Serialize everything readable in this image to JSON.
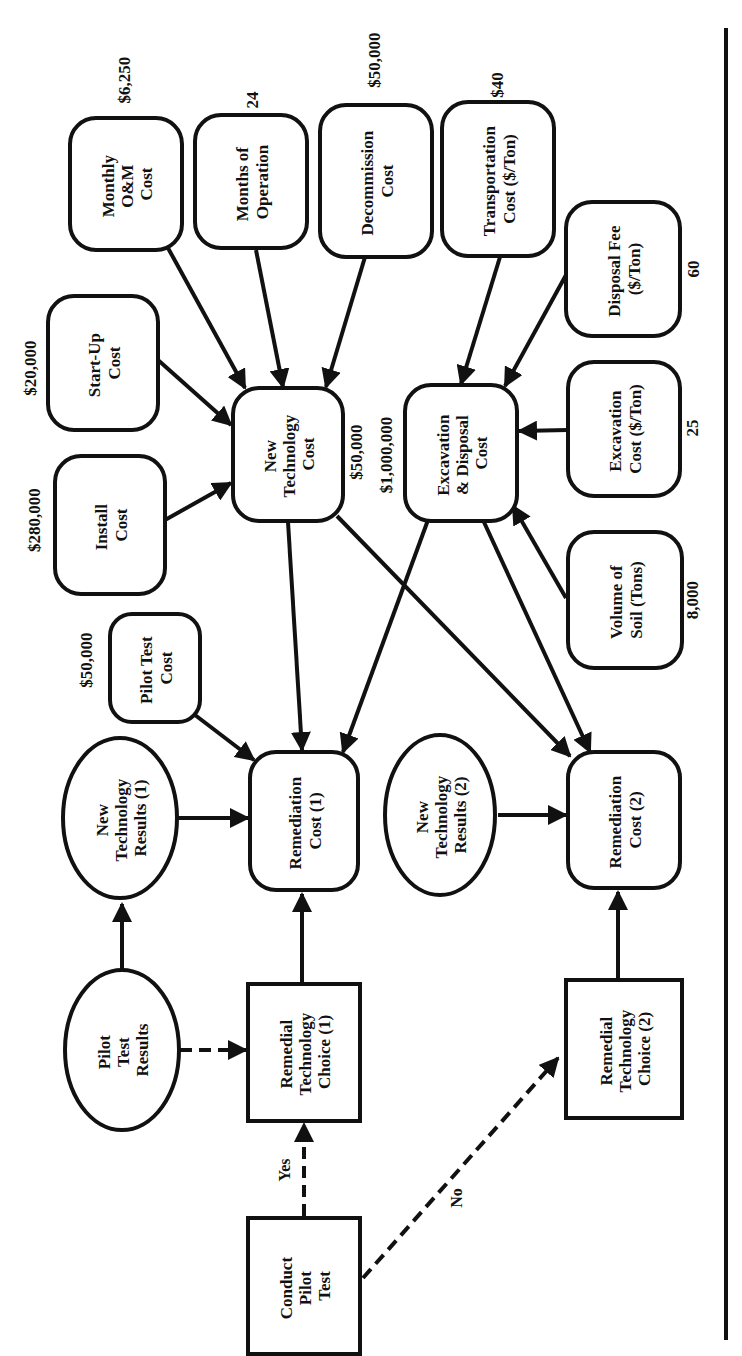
{
  "diagram": {
    "orientation": "rotated 90 degrees counter-clockwise",
    "colors": {
      "stroke": "#111111",
      "background": "#ffffff"
    },
    "nodes": [
      {
        "id": "monthly_om_cost",
        "shape": "rounded-rect",
        "lines": [
          "Monthly",
          "O&M",
          "Cost"
        ],
        "value": "$6,250"
      },
      {
        "id": "months_of_operation",
        "shape": "rounded-rect",
        "lines": [
          "Months of",
          "Operation"
        ],
        "value": "24"
      },
      {
        "id": "decommission_cost",
        "shape": "rounded-rect",
        "lines": [
          "Decommission",
          "Cost"
        ],
        "value": "$50,000"
      },
      {
        "id": "transportation_cost",
        "shape": "rounded-rect",
        "lines": [
          "Transportation",
          "Cost ($/Ton)"
        ],
        "value": "$40"
      },
      {
        "id": "disposal_fee",
        "shape": "rounded-rect",
        "lines": [
          "Disposal Fee",
          "($/Ton)"
        ],
        "value": "60"
      },
      {
        "id": "start_up_cost",
        "shape": "rounded-rect",
        "lines": [
          "Start-Up",
          "Cost"
        ],
        "value": "$20,000"
      },
      {
        "id": "install_cost",
        "shape": "rounded-rect",
        "lines": [
          "Install",
          "Cost"
        ],
        "value": "$280,000"
      },
      {
        "id": "new_technology_cost",
        "shape": "rounded-rect",
        "lines": [
          "New",
          "Technology",
          "Cost"
        ],
        "value": "$50,000"
      },
      {
        "id": "excavation_disposal_cost",
        "shape": "rounded-rect",
        "lines": [
          "Excavation",
          "& Disposal",
          "Cost"
        ],
        "value": "$1,000,000"
      },
      {
        "id": "excavation_cost",
        "shape": "rounded-rect",
        "lines": [
          "Excavation",
          "Cost ($/Ton)"
        ],
        "value": "25"
      },
      {
        "id": "volume_of_soil",
        "shape": "rounded-rect",
        "lines": [
          "Volume of",
          "Soil (Tons)"
        ],
        "value": "8,000"
      },
      {
        "id": "pilot_test_cost",
        "shape": "rounded-rect",
        "lines": [
          "Pilot Test",
          "Cost"
        ],
        "value": "$50,000"
      },
      {
        "id": "new_technology_results_1",
        "shape": "ellipse",
        "lines": [
          "New",
          "Technology",
          "Results (1)"
        ]
      },
      {
        "id": "remediation_cost_1",
        "shape": "rounded-rect",
        "lines": [
          "Remediation",
          "Cost (1)"
        ]
      },
      {
        "id": "new_technology_results_2",
        "shape": "ellipse",
        "lines": [
          "New",
          "Technology",
          "Results (2)"
        ]
      },
      {
        "id": "remediation_cost_2",
        "shape": "rounded-rect",
        "lines": [
          "Remediation",
          "Cost (2)"
        ]
      },
      {
        "id": "pilot_test_results",
        "shape": "ellipse",
        "lines": [
          "Pilot",
          "Test",
          "Results"
        ]
      },
      {
        "id": "remedial_technology_choice_1",
        "shape": "rect",
        "lines": [
          "Remedial",
          "Technology",
          "Choice (1)"
        ]
      },
      {
        "id": "remedial_technology_choice_2",
        "shape": "rect",
        "lines": [
          "Remedial",
          "Technology",
          "Choice (2)"
        ]
      },
      {
        "id": "conduct_pilot_test",
        "shape": "rect",
        "lines": [
          "Conduct",
          "Pilot",
          "Test"
        ]
      }
    ],
    "edges": [
      {
        "from": "monthly_om_cost",
        "to": "new_technology_cost",
        "style": "solid"
      },
      {
        "from": "months_of_operation",
        "to": "new_technology_cost",
        "style": "solid"
      },
      {
        "from": "decommission_cost",
        "to": "new_technology_cost",
        "style": "solid"
      },
      {
        "from": "start_up_cost",
        "to": "new_technology_cost",
        "style": "solid"
      },
      {
        "from": "install_cost",
        "to": "new_technology_cost",
        "style": "solid"
      },
      {
        "from": "transportation_cost",
        "to": "excavation_disposal_cost",
        "style": "solid"
      },
      {
        "from": "disposal_fee",
        "to": "excavation_disposal_cost",
        "style": "solid"
      },
      {
        "from": "excavation_cost",
        "to": "excavation_disposal_cost",
        "style": "solid"
      },
      {
        "from": "volume_of_soil",
        "to": "excavation_disposal_cost",
        "style": "solid"
      },
      {
        "from": "new_technology_cost",
        "to": "remediation_cost_1",
        "style": "solid"
      },
      {
        "from": "new_technology_cost",
        "to": "remediation_cost_2",
        "style": "solid"
      },
      {
        "from": "excavation_disposal_cost",
        "to": "remediation_cost_1",
        "style": "solid"
      },
      {
        "from": "excavation_disposal_cost",
        "to": "remediation_cost_2",
        "style": "solid"
      },
      {
        "from": "pilot_test_cost",
        "to": "remediation_cost_1",
        "style": "solid"
      },
      {
        "from": "new_technology_results_1",
        "to": "remediation_cost_1",
        "style": "solid"
      },
      {
        "from": "new_technology_results_2",
        "to": "remediation_cost_2",
        "style": "solid"
      },
      {
        "from": "pilot_test_results",
        "to": "new_technology_results_1",
        "style": "solid"
      },
      {
        "from": "pilot_test_results",
        "to": "remedial_technology_choice_1",
        "style": "dashed"
      },
      {
        "from": "remedial_technology_choice_1",
        "to": "remediation_cost_1",
        "style": "solid"
      },
      {
        "from": "remedial_technology_choice_2",
        "to": "remediation_cost_2",
        "style": "solid"
      },
      {
        "from": "conduct_pilot_test",
        "to": "remedial_technology_choice_1",
        "style": "dashed",
        "label": "Yes"
      },
      {
        "from": "conduct_pilot_test",
        "to": "remedial_technology_choice_2",
        "style": "dashed",
        "label": "No"
      }
    ]
  }
}
